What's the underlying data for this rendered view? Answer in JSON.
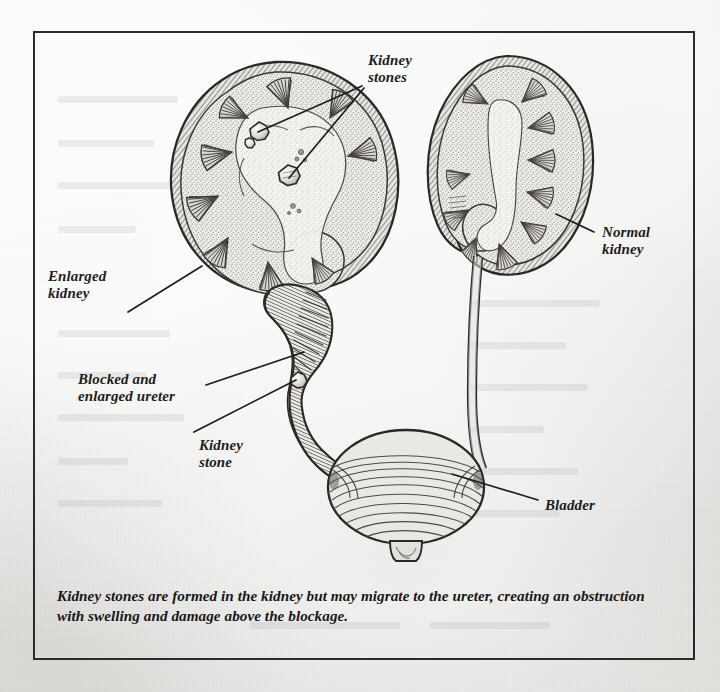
{
  "figure": {
    "caption": "Kidney stones are formed in the kidney but may migrate to the ureter, creating an obstruction with swelling and damage above the blockage.",
    "border_color": "#2b2b2b",
    "paper_color": "#e9e8e5",
    "ink_color": "#2a2a2a"
  },
  "labels": [
    {
      "id": "kidney-stones",
      "text": "Kidney\nstones",
      "x": 368,
      "y": 52,
      "align": "left"
    },
    {
      "id": "enlarged-kidney",
      "text": "Enlarged\nkidney",
      "x": 48,
      "y": 268,
      "align": "left"
    },
    {
      "id": "blocked-enlarged-ureter",
      "text": "Blocked and\nenlarged ureter",
      "x": 78,
      "y": 371,
      "align": "left"
    },
    {
      "id": "kidney-stone",
      "text": "Kidney\nstone",
      "x": 199,
      "y": 437,
      "align": "left"
    },
    {
      "id": "normal-kidney",
      "text": "Normal\nkidney",
      "x": 602,
      "y": 224,
      "align": "left"
    },
    {
      "id": "bladder",
      "text": "Bladder",
      "x": 545,
      "y": 497,
      "align": "left"
    }
  ],
  "leader_lines": [
    {
      "id": "leader-kidney-stone-upper",
      "from": [
        362,
        86
      ],
      "to": [
        258,
        132
      ]
    },
    {
      "id": "leader-kidney-stone-lower",
      "from": [
        362,
        88
      ],
      "to": [
        287,
        178
      ]
    },
    {
      "id": "leader-enlarged-kidney",
      "from": [
        128,
        312
      ],
      "to": [
        200,
        268
      ]
    },
    {
      "id": "leader-blocked-ureter",
      "from": [
        206,
        385
      ],
      "to": [
        302,
        356
      ]
    },
    {
      "id": "leader-ureter-stone",
      "from": [
        196,
        432
      ],
      "to": [
        296,
        380
      ]
    },
    {
      "id": "leader-normal-kidney",
      "from": [
        594,
        232
      ],
      "to": [
        556,
        216
      ]
    },
    {
      "id": "leader-bladder",
      "from": [
        538,
        500
      ],
      "to": [
        452,
        474
      ]
    }
  ],
  "anatomy": {
    "enlarged_kidney": {
      "name": "Enlarged (hydronephrotic) left kidney, sectioned",
      "cx": 272,
      "cy": 175
    },
    "normal_kidney": {
      "name": "Normal right kidney, sectioned",
      "cx": 507,
      "cy": 163
    },
    "enlarged_ureter": {
      "name": "Dilated, obstructed left ureter"
    },
    "normal_ureter": {
      "name": "Normal right ureter"
    },
    "bladder": {
      "name": "Urinary bladder",
      "cx": 406,
      "cy": 487
    },
    "urethra": {
      "name": "Urethra stub"
    },
    "stones": [
      {
        "id": "stone-calyx-1",
        "cx": 259,
        "cy": 131,
        "r": 8.5,
        "location": "renal calyx"
      },
      {
        "id": "stone-calyx-2",
        "cx": 249,
        "cy": 143,
        "r": 4.5,
        "location": "renal calyx"
      },
      {
        "id": "stone-pelvis",
        "cx": 288,
        "cy": 176,
        "r": 9.5,
        "location": "renal pelvis"
      },
      {
        "id": "stone-ureter",
        "cx": 298,
        "cy": 380,
        "r": 7.0,
        "location": "ureter"
      }
    ]
  }
}
